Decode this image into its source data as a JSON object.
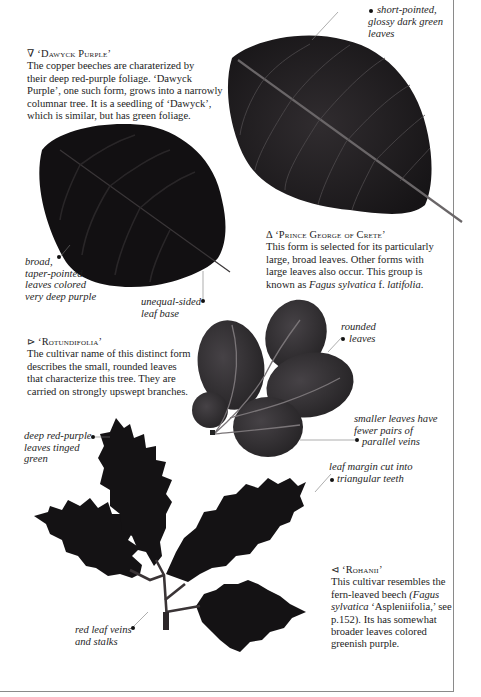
{
  "entries": [
    {
      "id": "dawyck-purple",
      "symbol": "∇",
      "title": "‘Dawyck Purple’",
      "lines": [
        "The copper beeches are charaterized by",
        "their deep red-purple foliage. ‘Dawyck",
        "Purple’, one such form, grows into a narrowly",
        "columnar tree. It is a seedling of ‘Dawyck’,",
        "which is similar, but has green foliage."
      ]
    },
    {
      "id": "prince-george-of-crete",
      "symbol": "Δ",
      "title": "‘Prince George of Crete’",
      "lines": [
        "This form is selected for its particularly",
        "large, broad leaves. Other forms with",
        "large leaves also occur. This group is"
      ],
      "last_line_prefix": "known as ",
      "last_line_italic": "Fagus sylvatica",
      "last_line_mid": " f. ",
      "last_line_italic2": "latifolia",
      "last_line_suffix": "."
    },
    {
      "id": "rotundifolia",
      "symbol": "⊳",
      "title": "‘Rotundifolia’",
      "lines": [
        "The cultivar name of this distinct form",
        "describes the small, rounded leaves",
        "that characterize this tree. They are",
        "carried on strongly upswept branches."
      ]
    },
    {
      "id": "rohanii",
      "symbol": "⊲",
      "title": "‘Rohanii’",
      "line1": "This cultivar resembles the",
      "line2_prefix": "fern-leaved beech ",
      "line2_italic": "(Fagus",
      "line3_italic": "sylvatica",
      "line3_suffix": " ‘Aspleniifolia,’ see",
      "line4": "p.152). Its has somewhat",
      "line5": "broader leaves colored",
      "line6": "greenish purple."
    }
  ],
  "annotations": {
    "short_pointed": [
      "short-pointed,",
      "glossy dark green",
      "leaves"
    ],
    "broad_taper": [
      "broad,",
      "taper-pointed",
      "leaves colored",
      "very deep purple"
    ],
    "unequal_sided": [
      "unequal-sided",
      "leaf base"
    ],
    "rounded": [
      "rounded",
      "leaves"
    ],
    "smaller_leaves": [
      "smaller leaves have",
      "fewer pairs of",
      "parallel veins"
    ],
    "deep_red_purple": [
      "deep red-purple",
      "leaves tinged",
      "green"
    ],
    "leaf_margin": [
      "leaf margin cut into",
      "triangular teeth"
    ],
    "red_veins": [
      "red leaf veins",
      "and stalks"
    ]
  },
  "colors": {
    "leaf_dark": "#141214",
    "leaf_mid": "#2a2729",
    "leaf_round": "#363336",
    "vein": "#5c585a",
    "border": "#8a8a8a"
  }
}
